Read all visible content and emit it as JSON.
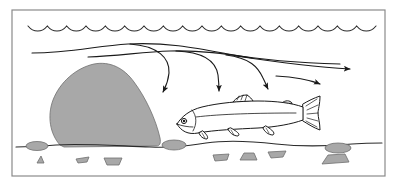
{
  "figure": {
    "name": "stream-flow-around-boulder",
    "background_color": "#ffffff",
    "line_color": "#1a1a1a",
    "frame": {
      "label": "figure-border",
      "color": "#8a8a8a",
      "stroke_width": 1.2,
      "x": 12,
      "y": 10,
      "width": 373,
      "height": 166
    }
  },
  "water_surface": {
    "label": "water-surface-wave-line",
    "scallop_count": 18,
    "y": 26,
    "x_start": 28,
    "x_end": 376,
    "amplitude": 3.2,
    "color": "#2b2b2b"
  },
  "flow": {
    "label": "current-streamlines",
    "color": "#1a1a1a",
    "stroke_width": 1.1,
    "direction": "left-to-right",
    "streamlines": [
      {
        "name": "upper-streamline-over-boulder",
        "has_arrowhead": false,
        "path": "M 32 53 C 70 53 96 46 128 44 C 166 42 196 48 228 54 C 262 60 300 63 340 64"
      },
      {
        "name": "second-streamline",
        "has_arrowhead": false,
        "path": "M 88 57 C 118 56 142 52 170 51 C 200 50 226 54 252 58"
      }
    ],
    "arrows": [
      {
        "name": "downwelling-arrow-1",
        "description": "curls down into the pocket immediately behind the boulder",
        "path": "M 130 44 C 158 46 170 58 169 73 C 168 83 165 88 163 92",
        "tip": [
          163,
          94
        ],
        "angle": 100
      },
      {
        "name": "downwelling-arrow-2",
        "description": "second eddy arrow curving down behind the boulder",
        "path": "M 176 51 C 204 52 216 62 218 75 C 219 84 219 88 219 91",
        "tip": [
          219,
          93
        ],
        "angle": 92
      },
      {
        "name": "downwelling-arrow-3",
        "description": "third arrow descending downstream of the pocket",
        "path": "M 226 55 C 250 58 258 67 263 78 C 266 84 267 87 268 89",
        "tip": [
          269,
          91
        ],
        "angle": 74
      },
      {
        "name": "downstream-horizontal-arrow",
        "description": "main downstream current running straight to the right margin",
        "path": "M 236 56 C 276 62 316 67 350 69",
        "tip": [
          356,
          69
        ],
        "angle": 6
      },
      {
        "name": "lower-right-arrow",
        "description": "short lower arrow angling down-right",
        "path": "M 276 76 C 296 77 310 80 320 84",
        "tip": [
          324,
          87
        ],
        "angle": 34
      }
    ]
  },
  "boulder": {
    "label": "midstream-boulder",
    "fill": "#a8a8a8",
    "stroke": "#6e6e6e",
    "stroke_width": 0.8,
    "path": "M 60 145 C 50 134 47 116 53 100 C 60 82 76 68 94 64 C 110 61 124 68 134 82 C 146 98 156 120 160 138 C 161 143 160 146 156 146 L 64 147 Z"
  },
  "streambed": {
    "label": "streambed-line",
    "color": "#2b2b2b",
    "stroke_width": 1.1,
    "path": "M 16 147 C 34 147 44 146 56 145 C 80 143 120 146 150 147 C 172 148 186 146 206 143 C 226 140 250 141 276 144 C 304 147 330 146 352 144 C 366 143 374 143 382 143"
  },
  "gravel": {
    "label": "streambed-gravel",
    "fill": "#a8a8a8",
    "stroke": "#6e6e6e",
    "stones": [
      {
        "name": "pebble-oval-left",
        "type": "ellipse",
        "cx": 37,
        "cy": 146,
        "rx": 11,
        "ry": 4.5
      },
      {
        "name": "pebble-triangle-1",
        "type": "poly",
        "points": "37,163 44,163 41,156"
      },
      {
        "name": "pebble-flake-1",
        "type": "poly",
        "points": "76,159 89,157 87,162 78,163"
      },
      {
        "name": "pebble-trapezoid-1",
        "type": "poly",
        "points": "104,158 122,158 119,165 107,165"
      },
      {
        "name": "pebble-oval-mid",
        "type": "ellipse",
        "cx": 174,
        "cy": 145,
        "rx": 12,
        "ry": 5
      },
      {
        "name": "pebble-flake-2",
        "type": "poly",
        "points": "213,155 229,154 227,160 215,161"
      },
      {
        "name": "pebble-dome-1",
        "type": "poly",
        "points": "240,160 257,160 254,153 244,153"
      },
      {
        "name": "pebble-flake-3",
        "type": "poly",
        "points": "268,152 286,151 283,157 271,158"
      },
      {
        "name": "pebble-oval-right",
        "type": "ellipse",
        "cx": 338,
        "cy": 148,
        "rx": 13,
        "ry": 5
      },
      {
        "name": "pebble-trapezoid-2",
        "type": "poly",
        "points": "322,164 349,162 345,154 328,155"
      }
    ]
  },
  "fish": {
    "label": "trout",
    "species_hint": "trout",
    "facing": "left",
    "fill": "#ffffff",
    "stroke": "#1a1a1a",
    "stroke_width": 1.0,
    "body_path": "M 177 124 C 182 116 190 110 202 107 C 218 103 240 101 258 101 C 276 101 292 103 303 107 L 303 120 C 292 124 276 127 258 128 C 238 129 214 130 198 133 C 188 135 181 131 177 124 Z",
    "lateral_line_path": "M 196 117 C 220 114 258 113 296 113",
    "gill_cover_path": "M 192 110 C 197 116 197 124 193 131",
    "jaw_path": "M 177 124 C 182 126 188 127 193 127",
    "eye": {
      "cx": 184,
      "cy": 121,
      "r": 2.6,
      "pupil_r": 1.2
    },
    "tail_path": "M 303 104 C 308 101 314 98 320 96 C 320 104 318 110 318 113 C 318 117 320 123 320 130 C 314 128 308 124 303 121 Z",
    "tail_rays": [
      "M 306 106 L 317 99",
      "M 307 110 L 318 105",
      "M 307 114 L 318 113",
      "M 307 118 L 318 121",
      "M 306 121 L 317 127"
    ],
    "dorsal_fin_path": "M 233 102 C 236 98 241 95 247 95 C 250 97 252 99 253 101 Z",
    "dorsal_rays": [
      "M 237 100 L 239 96",
      "M 241 100 L 243 95",
      "M 245 101 L 247 95"
    ],
    "adipose_fin_path": "M 282 103 C 285 100 290 100 292 103 Z",
    "pectoral_fin_path": "M 203 131 C 206 134 209 137 207 139 C 203 139 200 136 199 133 Z",
    "pelvic_fin_path": "M 231 128 C 236 131 241 134 238 136 C 233 136 229 132 228 129 Z",
    "anal_fin_path": "M 266 126 C 271 129 276 133 273 135 C 268 135 264 131 263 128 Z",
    "fin_ray_detail": [
      "M 202 133 L 205 138",
      "M 231 130 L 234 135",
      "M 266 128 L 269 133"
    ]
  }
}
